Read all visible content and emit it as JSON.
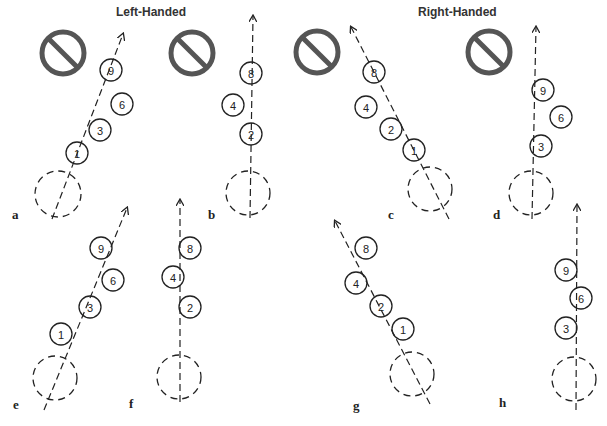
{
  "headings": {
    "left": "Left-Handed",
    "right": "Right-Handed"
  },
  "colors": {
    "ink": "#222222",
    "prohibit": "#555555",
    "background": "#ffffff"
  },
  "panels": [
    {
      "id": "a",
      "label": "a",
      "hand": "left",
      "prohibited": true,
      "prohibit": {
        "cx": 63,
        "cy": 53
      },
      "label_pos": {
        "x": 12,
        "y": 219
      },
      "ball": {
        "cx": 58,
        "cy": 194,
        "r": 23
      },
      "path": {
        "x1": 52,
        "y1": 219,
        "x2": 123,
        "y2": 34
      },
      "pins": [
        {
          "n": "9",
          "cx": 111,
          "cy": 70
        },
        {
          "n": "6",
          "cx": 122,
          "cy": 104
        },
        {
          "n": "3",
          "cx": 100,
          "cy": 130
        },
        {
          "n": "1",
          "cx": 77,
          "cy": 153
        }
      ]
    },
    {
      "id": "b",
      "label": "b",
      "hand": "left",
      "prohibited": true,
      "prohibit": {
        "cx": 192,
        "cy": 53
      },
      "label_pos": {
        "x": 208,
        "y": 219
      },
      "ball": {
        "cx": 248,
        "cy": 193,
        "r": 22
      },
      "path": {
        "x1": 250,
        "y1": 218,
        "x2": 253,
        "y2": 16
      },
      "pins": [
        {
          "n": "8",
          "cx": 251,
          "cy": 73
        },
        {
          "n": "4",
          "cx": 233,
          "cy": 105
        },
        {
          "n": "2",
          "cx": 251,
          "cy": 134
        }
      ]
    },
    {
      "id": "c",
      "label": "c",
      "hand": "right",
      "prohibited": true,
      "prohibit": {
        "cx": 317,
        "cy": 52
      },
      "label_pos": {
        "x": 388,
        "y": 219
      },
      "ball": {
        "cx": 430,
        "cy": 189,
        "r": 22
      },
      "path": {
        "x1": 449,
        "y1": 219,
        "x2": 351,
        "y2": 27
      },
      "pins": [
        {
          "n": "8",
          "cx": 374,
          "cy": 72
        },
        {
          "n": "4",
          "cx": 366,
          "cy": 107
        },
        {
          "n": "2",
          "cx": 391,
          "cy": 129
        },
        {
          "n": "1",
          "cx": 414,
          "cy": 150
        }
      ]
    },
    {
      "id": "d",
      "label": "d",
      "hand": "right",
      "prohibited": true,
      "prohibit": {
        "cx": 489,
        "cy": 52
      },
      "label_pos": {
        "x": 493,
        "y": 219
      },
      "ball": {
        "cx": 531,
        "cy": 193,
        "r": 22
      },
      "path": {
        "x1": 532,
        "y1": 219,
        "x2": 536,
        "y2": 27
      },
      "pins": [
        {
          "n": "9",
          "cx": 543,
          "cy": 90
        },
        {
          "n": "6",
          "cx": 561,
          "cy": 117
        },
        {
          "n": "3",
          "cx": 541,
          "cy": 146
        }
      ]
    },
    {
      "id": "e",
      "label": "e",
      "hand": "left",
      "prohibited": false,
      "label_pos": {
        "x": 13,
        "y": 409
      },
      "ball": {
        "cx": 55,
        "cy": 378,
        "r": 22
      },
      "path": {
        "x1": 44,
        "y1": 410,
        "x2": 127,
        "y2": 208
      },
      "pins": [
        {
          "n": "9",
          "cx": 101,
          "cy": 248
        },
        {
          "n": "6",
          "cx": 113,
          "cy": 280
        },
        {
          "n": "3",
          "cx": 90,
          "cy": 307
        },
        {
          "n": "1",
          "cx": 61,
          "cy": 334
        }
      ]
    },
    {
      "id": "f",
      "label": "f",
      "hand": "left",
      "prohibited": false,
      "label_pos": {
        "x": 129,
        "y": 408
      },
      "ball": {
        "cx": 179,
        "cy": 377,
        "r": 22
      },
      "path": {
        "x1": 180,
        "y1": 402,
        "x2": 180,
        "y2": 200
      },
      "pins": [
        {
          "n": "8",
          "cx": 190,
          "cy": 248
        },
        {
          "n": "4",
          "cx": 173,
          "cy": 277
        },
        {
          "n": "2",
          "cx": 190,
          "cy": 307
        }
      ]
    },
    {
      "id": "g",
      "label": "g",
      "hand": "right",
      "prohibited": false,
      "label_pos": {
        "x": 353,
        "y": 410
      },
      "ball": {
        "cx": 412,
        "cy": 374,
        "r": 22
      },
      "path": {
        "x1": 430,
        "y1": 404,
        "x2": 335,
        "y2": 221
      },
      "pins": [
        {
          "n": "8",
          "cx": 366,
          "cy": 248
        },
        {
          "n": "4",
          "cx": 356,
          "cy": 283
        },
        {
          "n": "2",
          "cx": 381,
          "cy": 306
        },
        {
          "n": "1",
          "cx": 403,
          "cy": 329
        }
      ]
    },
    {
      "id": "h",
      "label": "h",
      "hand": "right",
      "prohibited": false,
      "label_pos": {
        "x": 499,
        "y": 407
      },
      "ball": {
        "cx": 574,
        "cy": 379,
        "r": 22
      },
      "path": {
        "x1": 576,
        "y1": 410,
        "x2": 577,
        "y2": 205
      },
      "pins": [
        {
          "n": "9",
          "cx": 566,
          "cy": 270
        },
        {
          "n": "6",
          "cx": 581,
          "cy": 298
        },
        {
          "n": "3",
          "cx": 566,
          "cy": 328
        }
      ]
    }
  ],
  "pin_radius": 11,
  "prohibit_radius": 21
}
